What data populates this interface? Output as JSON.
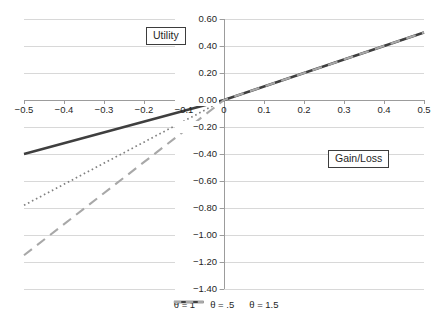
{
  "chart_data": {
    "type": "line",
    "title": "",
    "axis_boxes": {
      "y_label": "Utility",
      "x_label": "Gain/Loss"
    },
    "xlim": [
      -0.5,
      0.5
    ],
    "ylim": [
      -1.4,
      0.6
    ],
    "grid": "horizontal",
    "legend_position": "bottom-center",
    "x_ticks": [
      {
        "value": -0.5,
        "label": "−0.5"
      },
      {
        "value": -0.4,
        "label": "−0.4"
      },
      {
        "value": -0.3,
        "label": "−0.3"
      },
      {
        "value": -0.2,
        "label": "−0.2"
      },
      {
        "value": -0.1,
        "label": "−0.1"
      },
      {
        "value": 0,
        "label": "0"
      },
      {
        "value": 0.1,
        "label": "0.1"
      },
      {
        "value": 0.2,
        "label": "0.2"
      },
      {
        "value": 0.3,
        "label": "0.3"
      },
      {
        "value": 0.4,
        "label": "0.4"
      },
      {
        "value": 0.5,
        "label": "0.5"
      }
    ],
    "y_ticks": [
      {
        "value": 0.6,
        "label": "0.60"
      },
      {
        "value": 0.4,
        "label": "0.40"
      },
      {
        "value": 0.2,
        "label": "0.20"
      },
      {
        "value": 0.0,
        "label": "0.00"
      },
      {
        "value": -0.2,
        "label": "−0.20"
      },
      {
        "value": -0.4,
        "label": "−0.40"
      },
      {
        "value": -0.6,
        "label": "−0.60"
      },
      {
        "value": -0.8,
        "label": "−0.80"
      },
      {
        "value": -1.0,
        "label": "−1.00"
      },
      {
        "value": -1.2,
        "label": "−1.20"
      },
      {
        "value": -1.4,
        "label": "−1.40"
      }
    ],
    "series": [
      {
        "name": "θ = 1",
        "line_style": "dotted",
        "color": "#808080",
        "points": [
          [
            -0.5,
            -0.78
          ],
          [
            0,
            0
          ],
          [
            0.5,
            0.5
          ]
        ]
      },
      {
        "name": "θ = .5",
        "line_style": "solid",
        "color": "#3f3f3f",
        "points": [
          [
            -0.5,
            -0.4
          ],
          [
            0,
            0
          ],
          [
            0.5,
            0.5
          ]
        ]
      },
      {
        "name": "θ = 1.5",
        "line_style": "dashed",
        "color": "#a8a8a8",
        "points": [
          [
            -0.5,
            -1.15
          ],
          [
            0,
            0
          ],
          [
            0.5,
            0.5
          ]
        ]
      }
    ],
    "colors": {
      "gridline": "#d8d8d8",
      "axis": "#9c9c9c",
      "text": "#1f1f1f"
    }
  }
}
